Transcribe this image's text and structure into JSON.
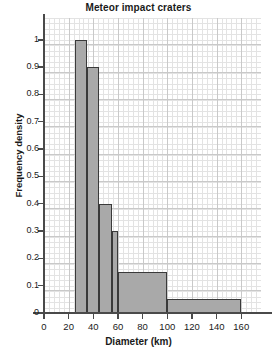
{
  "chart_data": {
    "type": "bar",
    "title": "Meteor impact craters",
    "xlabel": "Diameter (km)",
    "ylabel": "Frequency density",
    "xlim": [
      0,
      176
    ],
    "ylim": [
      0,
      1.08
    ],
    "grid": true,
    "legend": false,
    "bin_edges": [
      25,
      35,
      45,
      55,
      60,
      100,
      160
    ],
    "bins": [
      {
        "label": "25-35",
        "start": 25,
        "end": 35,
        "value": 1.0
      },
      {
        "label": "35-45",
        "start": 35,
        "end": 45,
        "value": 0.9
      },
      {
        "label": "45-55",
        "start": 45,
        "end": 55,
        "value": 0.4
      },
      {
        "label": "55-60",
        "start": 55,
        "end": 60,
        "value": 0.3
      },
      {
        "label": "60-100",
        "start": 60,
        "end": 100,
        "value": 0.15
      },
      {
        "label": "100-160",
        "start": 100,
        "end": 160,
        "value": 0.05
      }
    ],
    "xticks": [
      0,
      20,
      40,
      60,
      80,
      100,
      120,
      140,
      160
    ],
    "xtick_labels": [
      "0",
      "20",
      "40",
      "60",
      "80",
      "100",
      "120",
      "140",
      "160"
    ],
    "yticks": [
      0,
      0.1,
      0.2,
      0.3,
      0.4,
      0.5,
      0.6,
      0.7,
      0.8,
      0.9,
      1.0
    ],
    "ytick_labels": [
      "0",
      "0.1",
      "0.2",
      "0.3",
      "0.4",
      "0.5",
      "0.6",
      "0.7",
      "0.8",
      "0.9",
      "1"
    ],
    "colors": {
      "bar_fill": "#a9a9a9",
      "bar_stroke": "#3a3a3a",
      "axis": "#4a4a4a",
      "grid_minor": "#e3e3e3",
      "grid_major": "#c9c9c9",
      "text": "#1a1a1a",
      "background": "#ffffff"
    }
  }
}
